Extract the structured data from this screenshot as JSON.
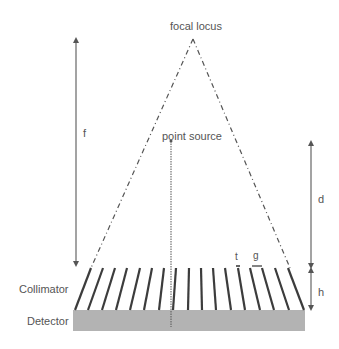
{
  "labels": {
    "focal_locus": "focal locus",
    "point_source": "point source",
    "f": "f",
    "d": "d",
    "h": "h",
    "t": "t",
    "g": "g",
    "collimator": "Collimator",
    "detector": "Detector"
  },
  "colors": {
    "lines": "#555555",
    "detector_fill": "#b3b3b3",
    "text": "#555555"
  }
}
